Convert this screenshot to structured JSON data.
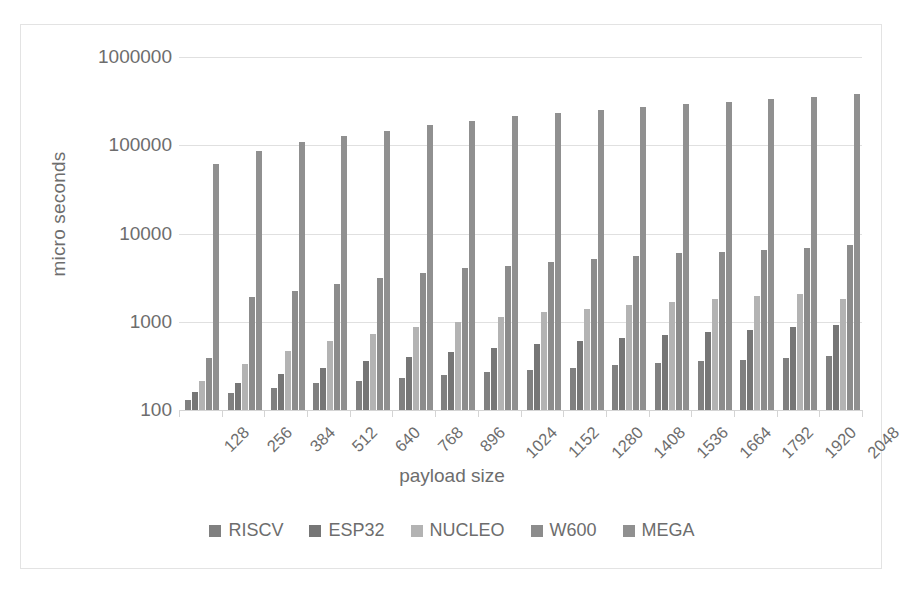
{
  "chart_data": {
    "type": "bar",
    "title": "",
    "xlabel": "payload size",
    "ylabel": "micro seconds",
    "yscale": "log",
    "ylim": [
      100,
      1000000
    ],
    "yticks": [
      100,
      1000,
      10000,
      100000,
      1000000
    ],
    "ytick_labels": [
      "100",
      "1000",
      "10000",
      "100000",
      "1000000"
    ],
    "grid": true,
    "legend_position": "bottom",
    "categories": [
      "128",
      "256",
      "384",
      "512",
      "640",
      "768",
      "896",
      "1024",
      "1152",
      "1280",
      "1408",
      "1536",
      "1664",
      "1792",
      "1920",
      "2048"
    ],
    "series": [
      {
        "name": "RISCV",
        "color": "#808080",
        "values": [
          130,
          155,
          178,
          200,
          215,
          230,
          248,
          268,
          285,
          300,
          320,
          340,
          355,
          370,
          390,
          410
        ]
      },
      {
        "name": "ESP32",
        "color": "#767676",
        "values": [
          162,
          200,
          255,
          300,
          355,
          400,
          450,
          505,
          555,
          610,
          660,
          710,
          760,
          815,
          865,
          915
        ]
      },
      {
        "name": "NUCLEO",
        "color": "#b3b3b3",
        "values": [
          215,
          330,
          465,
          600,
          730,
          870,
          1000,
          1140,
          1280,
          1400,
          1540,
          1670,
          1800,
          1940,
          2070,
          1790
        ]
      },
      {
        "name": "W600",
        "color": "#8c8c8c",
        "values": [
          390,
          1900,
          2250,
          2700,
          3150,
          3600,
          4060,
          4250,
          4700,
          5150,
          5500,
          6000,
          6200,
          6550,
          6900,
          7400
        ]
      },
      {
        "name": "MEGA",
        "color": "#909090",
        "values": [
          62000,
          85000,
          108000,
          128000,
          146000,
          168000,
          190000,
          212000,
          232000,
          252000,
          272000,
          296000,
          312000,
          332000,
          355000,
          378000
        ]
      }
    ]
  },
  "axis": {
    "y_title": "micro seconds",
    "x_title": "payload size"
  }
}
